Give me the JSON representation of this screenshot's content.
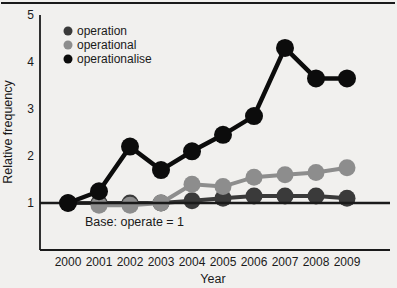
{
  "figure": {
    "background": "#f1f0ee",
    "top_rule_color": "#4a4a4a"
  },
  "chart_data": {
    "type": "line",
    "title": "",
    "xlabel": "Year",
    "ylabel": "Relative frequency",
    "x": [
      2000,
      2001,
      2002,
      2003,
      2004,
      2005,
      2006,
      2007,
      2008,
      2009
    ],
    "yticks": [
      1,
      2,
      3,
      4,
      5
    ],
    "ylim": [
      0,
      5
    ],
    "grid": false,
    "legend_position": "top-left",
    "axis_color": "#1a1a1a",
    "baseline_value": 1,
    "baseline_annotation": "Base: operate = 1",
    "series": [
      {
        "name": "operation",
        "color": "#3a3a3a",
        "values": [
          1.0,
          1.0,
          1.0,
          1.0,
          1.05,
          1.1,
          1.15,
          1.15,
          1.15,
          1.1
        ]
      },
      {
        "name": "operational",
        "color": "#8d8d8d",
        "values": [
          null,
          0.95,
          0.95,
          1.0,
          1.4,
          1.35,
          1.55,
          1.6,
          1.65,
          1.75
        ]
      },
      {
        "name": "operationalise",
        "color": "#0c0c0c",
        "values": [
          1.0,
          1.25,
          2.2,
          1.7,
          2.1,
          2.45,
          2.85,
          4.3,
          3.65,
          3.65
        ]
      }
    ]
  }
}
